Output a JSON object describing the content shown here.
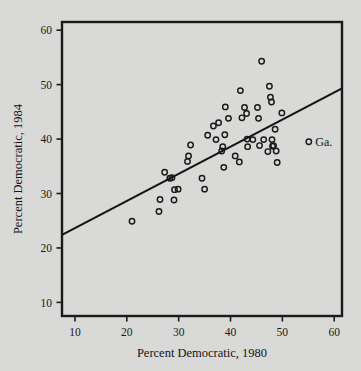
{
  "figure": {
    "background_color": "#d9d9d7",
    "frame_color": "#1a1a1a",
    "marker_color": "#1a1a1a",
    "line_color": "#141414"
  },
  "chart_data": {
    "type": "scatter",
    "title": "",
    "xlabel": "Percent Democratic, 1980",
    "ylabel": "Percent Democratic, 1984",
    "xlim": [
      7.5,
      61.5
    ],
    "ylim": [
      7.5,
      61.5
    ],
    "xticks": [
      10,
      20,
      30,
      40,
      50,
      60
    ],
    "yticks": [
      10,
      20,
      30,
      40,
      50,
      60
    ],
    "xticklabels": [
      "10",
      "20",
      "30",
      "40",
      "50",
      "60"
    ],
    "yticklabels": [
      "10",
      "20",
      "30",
      "40",
      "50",
      "60"
    ],
    "grid": false,
    "legend": null,
    "marker": "open-circle",
    "points": [
      {
        "x": 21.0,
        "y": 24.9
      },
      {
        "x": 26.2,
        "y": 26.7
      },
      {
        "x": 26.4,
        "y": 28.9
      },
      {
        "x": 27.3,
        "y": 33.9
      },
      {
        "x": 28.3,
        "y": 32.8
      },
      {
        "x": 28.7,
        "y": 32.9
      },
      {
        "x": 29.1,
        "y": 28.8
      },
      {
        "x": 29.2,
        "y": 30.7
      },
      {
        "x": 29.9,
        "y": 30.8
      },
      {
        "x": 31.7,
        "y": 35.9
      },
      {
        "x": 31.9,
        "y": 36.9
      },
      {
        "x": 32.3,
        "y": 38.9
      },
      {
        "x": 34.5,
        "y": 32.8
      },
      {
        "x": 35.0,
        "y": 30.8
      },
      {
        "x": 35.6,
        "y": 40.7
      },
      {
        "x": 36.7,
        "y": 42.4
      },
      {
        "x": 37.2,
        "y": 39.9
      },
      {
        "x": 37.7,
        "y": 43.0
      },
      {
        "x": 38.3,
        "y": 37.8
      },
      {
        "x": 38.5,
        "y": 38.6
      },
      {
        "x": 38.7,
        "y": 34.8
      },
      {
        "x": 38.9,
        "y": 40.8
      },
      {
        "x": 39.0,
        "y": 45.9
      },
      {
        "x": 39.6,
        "y": 43.8
      },
      {
        "x": 40.9,
        "y": 36.9
      },
      {
        "x": 41.7,
        "y": 35.8
      },
      {
        "x": 41.9,
        "y": 48.9
      },
      {
        "x": 42.2,
        "y": 43.9
      },
      {
        "x": 42.7,
        "y": 45.8
      },
      {
        "x": 43.1,
        "y": 44.7
      },
      {
        "x": 43.2,
        "y": 40.0
      },
      {
        "x": 43.3,
        "y": 38.6
      },
      {
        "x": 44.3,
        "y": 39.9
      },
      {
        "x": 45.2,
        "y": 45.8
      },
      {
        "x": 45.4,
        "y": 43.8
      },
      {
        "x": 45.6,
        "y": 38.8
      },
      {
        "x": 46.0,
        "y": 54.3
      },
      {
        "x": 46.4,
        "y": 39.9
      },
      {
        "x": 47.2,
        "y": 37.7
      },
      {
        "x": 47.5,
        "y": 49.7
      },
      {
        "x": 47.7,
        "y": 47.7
      },
      {
        "x": 47.9,
        "y": 46.8
      },
      {
        "x": 48.0,
        "y": 39.9
      },
      {
        "x": 48.1,
        "y": 38.7
      },
      {
        "x": 48.3,
        "y": 38.8
      },
      {
        "x": 48.6,
        "y": 41.8
      },
      {
        "x": 48.8,
        "y": 37.8
      },
      {
        "x": 49.0,
        "y": 35.7
      },
      {
        "x": 49.9,
        "y": 44.8
      },
      {
        "x": 55.1,
        "y": 39.5,
        "label": "Ga."
      }
    ],
    "fit_line": {
      "x_start": 7.5,
      "y_start": 22.4,
      "x_end": 61.5,
      "y_end": 49.3
    }
  }
}
